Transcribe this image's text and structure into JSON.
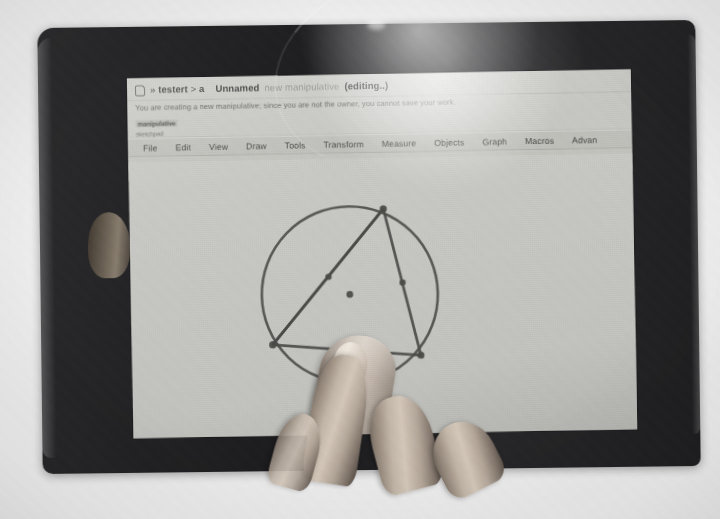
{
  "photo": {
    "subject": "tablet-showing-geometry-app",
    "device": "tablet",
    "held_by": "hand"
  },
  "app": {
    "header": {
      "logo_icon": "app-logo-icon",
      "breadcrumb_user": "testert",
      "breadcrumb_sep": ">",
      "breadcrumb_arrow": "»",
      "breadcrumb_item": "a",
      "doc_title": "Unnamed",
      "doc_subtitle": "new manipulative",
      "doc_state": "(editing..)"
    },
    "warning": {
      "text": "You are creating a new manipulative; since you are not the owner, you cannot save your work.",
      "badge": "manipulative",
      "badge2": "sketchpad"
    },
    "menubar": {
      "items": [
        {
          "label": "File"
        },
        {
          "label": "Edit"
        },
        {
          "label": "View"
        },
        {
          "label": "Draw"
        },
        {
          "label": "Tools"
        },
        {
          "label": "Transform"
        },
        {
          "label": "Measure"
        },
        {
          "label": "Objects"
        },
        {
          "label": "Graph"
        },
        {
          "label": "Macros"
        },
        {
          "label": "Advan"
        }
      ]
    },
    "toolbar": {
      "items": [
        {
          "icon": "undo-icon",
          "title": "Undo"
        },
        {
          "icon": "redo-icon",
          "title": "Redo"
        },
        {
          "icon": "delete-icon",
          "title": "Delete"
        },
        {
          "icon": "pointer-icon",
          "title": "Select"
        },
        {
          "icon": "pen-icon",
          "title": "Freehand"
        },
        {
          "icon": "point-icon",
          "title": "Point"
        },
        {
          "icon": "segment-icon",
          "title": "Segment"
        },
        {
          "icon": "line-icon",
          "title": "Line"
        },
        {
          "icon": "ray-icon",
          "title": "Ray"
        },
        {
          "icon": "circle-icon",
          "title": "Circle"
        },
        {
          "icon": "measure-icon",
          "title": "Measure"
        }
      ],
      "checkbox_icon": "checkbox-checked-icon",
      "label": "fig",
      "zoom_icon": "magnifier-icon"
    },
    "canvas": {
      "background": "#cbcbc7",
      "stroke": "#4a4a48"
    }
  },
  "chart_data": {
    "type": "scatter",
    "xlabel": "",
    "ylabel": "",
    "xlim": [
      0,
      504
    ],
    "ylim": [
      0,
      276
    ],
    "grid": false,
    "shapes": [
      {
        "name": "circumcircle",
        "type": "circle",
        "cx": 219,
        "cy": 136,
        "r": 88,
        "stroke": "#4a4a48",
        "width": 2.6
      },
      {
        "name": "triangle",
        "type": "polygon",
        "points": [
          [
            254,
            51
          ],
          [
            289,
            198
          ],
          [
            141,
            185
          ]
        ],
        "stroke": "#4a4a48",
        "width": 2.8,
        "fill": "none"
      },
      {
        "name": "chord-to-vertex",
        "type": "segment",
        "from": [
          254,
          51
        ],
        "to": [
          141,
          185
        ],
        "stroke": "#4a4a48",
        "width": 2.6
      }
    ],
    "points": [
      {
        "name": "A",
        "x": 254,
        "y": 51,
        "kind": "vertex",
        "r": 3.6
      },
      {
        "name": "B",
        "x": 289,
        "y": 198,
        "kind": "vertex",
        "r": 3.6
      },
      {
        "name": "C",
        "x": 141,
        "y": 185,
        "kind": "vertex",
        "r": 3.6
      },
      {
        "name": "M1",
        "x": 198,
        "y": 118,
        "kind": "midpoint",
        "r": 3.2
      },
      {
        "name": "M2",
        "x": 272,
        "y": 125,
        "kind": "midpoint",
        "r": 3.2
      },
      {
        "name": "O",
        "x": 219,
        "y": 136,
        "kind": "center",
        "r": 3.4
      }
    ],
    "annotations": []
  }
}
